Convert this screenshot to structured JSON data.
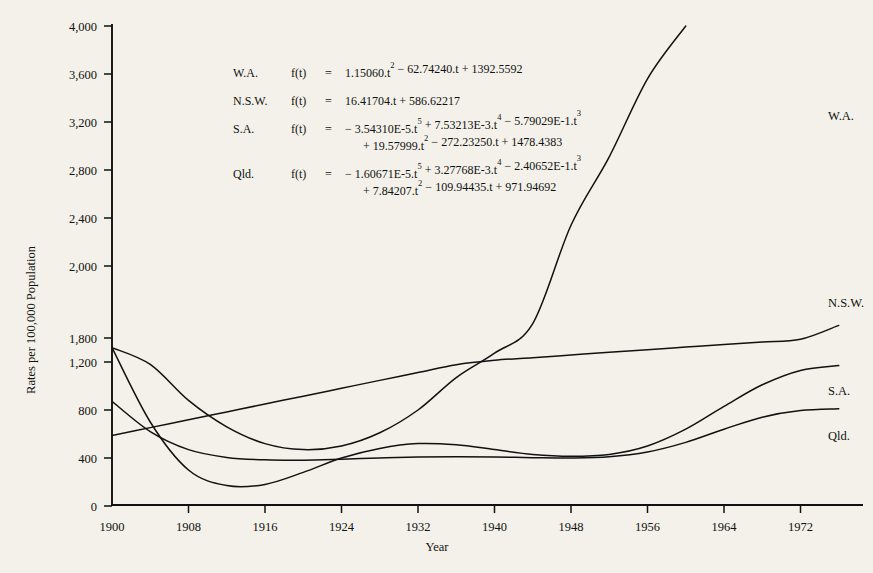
{
  "chart_data": {
    "type": "line",
    "title": "",
    "xlabel": "Year",
    "ylabel": "Rates per 100,000 Population",
    "xlim": [
      1900,
      1976
    ],
    "ylim": [
      0,
      4000
    ],
    "grid": false,
    "legend_position": "right-inline",
    "xticks": [
      "1900",
      "1908",
      "1916",
      "1924",
      "1932",
      "1940",
      "1948",
      "1956",
      "1964",
      "1972"
    ],
    "xtick_values": [
      1900,
      1908,
      1916,
      1924,
      1932,
      1940,
      1948,
      1956,
      1964,
      1972
    ],
    "yticks": [
      "4,000",
      "3,600",
      "3,200",
      "2,800",
      "2,400",
      "2,000",
      "1,800",
      "1,200",
      "800",
      "400",
      "0"
    ],
    "ytick_values": [
      4000,
      3600,
      3200,
      2800,
      2400,
      2000,
      1800,
      1200,
      800,
      400,
      0
    ],
    "x": [
      1900,
      1904,
      1908,
      1912,
      1916,
      1920,
      1924,
      1928,
      1932,
      1936,
      1940,
      1944,
      1948,
      1952,
      1956,
      1960,
      1964,
      1968,
      1972,
      1976
    ],
    "series": [
      {
        "name": "W.A.",
        "values": [
          1560,
          1180,
          880,
          660,
          520,
          470,
          500,
          610,
          800,
          1070,
          1420,
          1840,
          2340,
          2910,
          3560,
          4000,
          4000,
          4000,
          4000,
          4000
        ]
      },
      {
        "name": "N.S.W.",
        "values": [
          587,
          653,
          718,
          784,
          850,
          915,
          981,
          1047,
          1112,
          1178,
          1244,
          1309,
          1375,
          1441,
          1506,
          1572,
          1638,
          1703,
          1769,
          1835
        ]
      },
      {
        "name": "S.A.",
        "values": [
          1560,
          700,
          300,
          170,
          180,
          280,
          400,
          480,
          520,
          510,
          470,
          430,
          415,
          430,
          500,
          640,
          830,
          1010,
          1130,
          1170
        ]
      },
      {
        "name": "Qld.",
        "values": [
          872,
          620,
          470,
          405,
          385,
          382,
          390,
          400,
          408,
          410,
          408,
          403,
          400,
          410,
          450,
          530,
          640,
          740,
          795,
          810
        ]
      }
    ]
  },
  "equations": [
    {
      "name": "W.A.",
      "fn": "f(t)",
      "eq": "=",
      "lines": [
        [
          {
            "t": "1.15060.t",
            "sup": "2"
          },
          {
            "t": " − 62.74240.t + 1392.5592",
            "sup": ""
          }
        ]
      ]
    },
    {
      "name": "N.S.W.",
      "fn": "f(t)",
      "eq": "=",
      "lines": [
        [
          {
            "t": "16.41704.t + 586.62217",
            "sup": ""
          }
        ]
      ]
    },
    {
      "name": "S.A.",
      "fn": "f(t)",
      "eq": "=",
      "lines": [
        [
          {
            "t": "− 3.54310E-5.t",
            "sup": "5"
          },
          {
            "t": " + 7.53213E-3.t",
            "sup": "4"
          },
          {
            "t": " − 5.79029E-1.t",
            "sup": "3"
          }
        ],
        [
          {
            "t": "+ 19.57999.t",
            "sup": "2"
          },
          {
            "t": " − 272.23250.t + 1478.4383",
            "sup": ""
          }
        ]
      ]
    },
    {
      "name": "Qld.",
      "fn": "f(t)",
      "eq": "=",
      "lines": [
        [
          {
            "t": "− 1.60671E-5.t",
            "sup": "5"
          },
          {
            "t": " + 3.27768E-3.t",
            "sup": "4"
          },
          {
            "t": " − 2.40652E-1.t",
            "sup": "3"
          }
        ],
        [
          {
            "t": "+ 7.84207.t",
            "sup": "2"
          },
          {
            "t": " − 109.94435.t + 971.94692",
            "sup": ""
          }
        ]
      ]
    }
  ],
  "colors": {
    "background": "#f3f1e9",
    "ink": "#111111"
  }
}
